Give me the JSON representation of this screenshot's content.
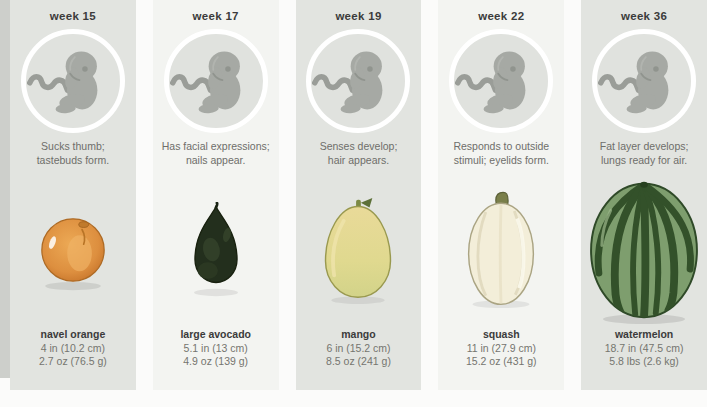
{
  "infographic_title": "fetal development size comparison",
  "columns": [
    {
      "week": "week 15",
      "description": "Sucks thumb;\ntastebuds form.",
      "fruit": "navel orange",
      "length": "4 in (10.2 cm)",
      "weight": "2.7 oz (76.5 g)",
      "fruit_icon": "navel-orange-icon"
    },
    {
      "week": "week 17",
      "description": "Has facial expressions;\nnails appear.",
      "fruit": "large avocado",
      "length": "5.1 in (13 cm)",
      "weight": "4.9 oz (139 g)",
      "fruit_icon": "avocado-icon"
    },
    {
      "week": "week 19",
      "description": "Senses develop;\nhair appears.",
      "fruit": "mango",
      "length": "6 in (15.2 cm)",
      "weight": "8.5 oz (241 g)",
      "fruit_icon": "mango-icon"
    },
    {
      "week": "week 22",
      "description": "Responds to outside\nstimuli; eyelids form.",
      "fruit": "squash",
      "length": "11 in (27.9 cm)",
      "weight": "15.2 oz (431 g)",
      "fruit_icon": "squash-icon"
    },
    {
      "week": "week 36",
      "description": "Fat layer develops;\nlungs ready for air.",
      "fruit": "watermelon",
      "length": "18.7 in (47.5 cm)",
      "weight": "5.8 lbs (2.6 kg)",
      "fruit_icon": "watermelon-icon"
    }
  ],
  "icons": {
    "fetus": "fetus-icon",
    "fruits": [
      "navel-orange-icon",
      "avocado-icon",
      "mango-icon",
      "squash-icon",
      "watermelon-icon"
    ]
  },
  "colors": {
    "card_gray": "#e2e4e0",
    "card_light": "#f3f4f1",
    "page_background": "#fbfbfa",
    "circle_ring": "#ffffff",
    "fetus_gray": "#a6a9a4",
    "heading_text": "#3b3b3b",
    "secondary_text": "#75756f",
    "orange": "#dd8f3f",
    "avocado_green": "#232f1d",
    "mango_yellow": "#e3d891",
    "squash_cream": "#f3eed9",
    "watermelon_green": "#7e9e6e",
    "watermelon_stripe": "#33512a"
  }
}
